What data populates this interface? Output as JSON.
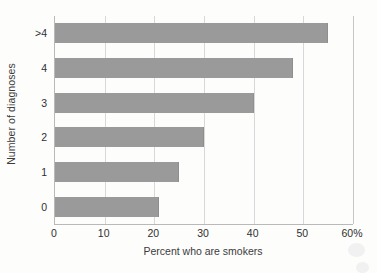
{
  "chart_data": {
    "type": "bar",
    "orientation": "horizontal",
    "title": "",
    "xlabel": "Percent who are smokers",
    "ylabel": "Number of diagnoses",
    "categories": [
      "0",
      "1",
      "2",
      "3",
      "4",
      ">4"
    ],
    "values": [
      21,
      25,
      30,
      40,
      48,
      55
    ],
    "xlim": [
      0,
      60
    ],
    "xticks": [
      0,
      10,
      20,
      30,
      40,
      50,
      60
    ],
    "xticklabels": [
      "0",
      "10",
      "20",
      "30",
      "40",
      "50",
      "60%"
    ],
    "grid": "vertical",
    "legend": "none",
    "bar_color": "#9a9a9a",
    "gridline_color": "#d8d8d8",
    "axis_color": "#b9b9b9",
    "background_color": "#fdfdfc",
    "series": [
      {
        "name": "Percent who are smokers",
        "points": [
          {
            "category": "0",
            "value": 21
          },
          {
            "category": "1",
            "value": 25
          },
          {
            "category": "2",
            "value": 30
          },
          {
            "category": "3",
            "value": 40
          },
          {
            "category": "4",
            "value": 48
          },
          {
            "category": ">4",
            "value": 55
          }
        ]
      }
    ]
  }
}
